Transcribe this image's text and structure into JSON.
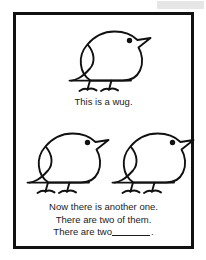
{
  "page": {
    "background_color": "#ffffff",
    "frame_color": "#111111",
    "text_color": "#1b1b1b",
    "accent_band_color": "#e6e6e6"
  },
  "top_panel": {
    "figure": {
      "name": "wug-bird",
      "count": 1,
      "description": "cartoon outline bird with dot eye, pointed beak, two thin legs"
    },
    "caption": {
      "lines": [
        "This is a wug."
      ]
    }
  },
  "bottom_panel": {
    "figure": {
      "name": "wug-bird",
      "count": 2,
      "description": "two identical cartoon outline birds side by side"
    },
    "caption": {
      "lines": [
        "Now there is another one.",
        "There are two of them.",
        "There are two"
      ],
      "blank_answer_value": "",
      "trailing_punctuation": "."
    }
  }
}
